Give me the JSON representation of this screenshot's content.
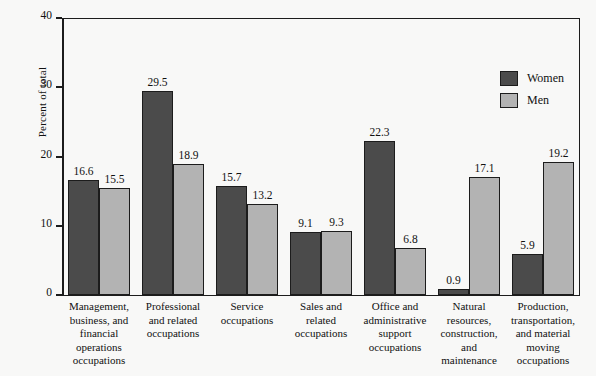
{
  "chart_data": {
    "type": "bar",
    "title": "",
    "xlabel": "",
    "ylabel": "Percent of total",
    "ylim": [
      0,
      40
    ],
    "yticks": [
      0,
      10,
      20,
      30,
      40
    ],
    "ytick_labels": [
      "0",
      "10",
      "20",
      "30",
      "40"
    ],
    "grid": false,
    "legend_position": "upper-right-inside",
    "categories": [
      "Management,\nbusiness, and\nfinancial\noperations\noccupations",
      "Professional\nand related\noccupations",
      "Service\noccupations",
      "Sales and\nrelated\noccupations",
      "Office and\nadministrative\nsupport\noccupations",
      "Natural\nresources,\nconstruction,\nand\nmaintenance",
      "Production,\ntransportation,\nand material\nmoving\noccupations"
    ],
    "series": [
      {
        "name": "Women",
        "color": "#4b4b4b",
        "values": [
          16.6,
          29.5,
          15.7,
          9.1,
          22.3,
          0.9,
          5.9
        ],
        "value_labels": [
          "16.6",
          "29.5",
          "15.7",
          "9.1",
          "22.3",
          "0.9",
          "5.9"
        ]
      },
      {
        "name": "Men",
        "color": "#b3b3b3",
        "values": [
          15.5,
          18.9,
          13.2,
          9.3,
          6.8,
          17.1,
          19.2
        ],
        "value_labels": [
          "15.5",
          "18.9",
          "13.2",
          "9.3",
          "6.8",
          "17.1",
          "19.2"
        ]
      }
    ]
  },
  "colors": {
    "background": "#f8f8f7",
    "axis": "#1c1c1c",
    "women": "#4b4b4b",
    "men": "#b3b3b3"
  }
}
